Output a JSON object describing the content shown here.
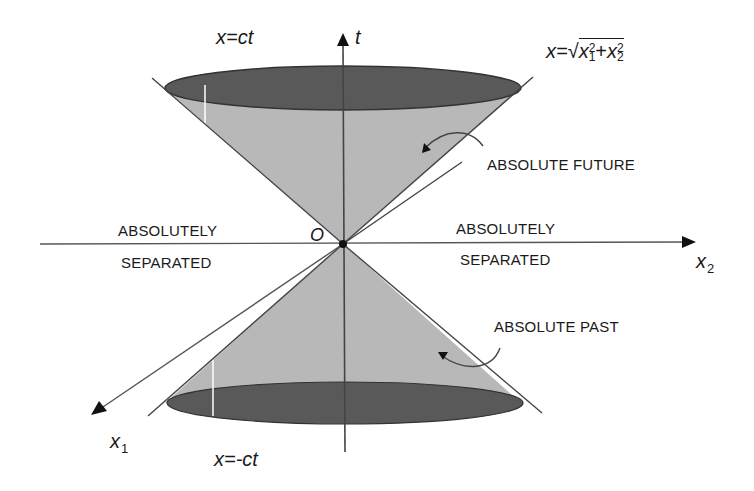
{
  "diagram": {
    "colors": {
      "cone_fill": "#b8b8b8",
      "ellipse_fill": "#595959",
      "lines": "#444444",
      "text": "#1a1a1a",
      "background": "#ffffff"
    },
    "axes": {
      "t_label": "t",
      "x1_label": "x",
      "x1_sub": "1",
      "x2_label": "x",
      "x2_sub": "2",
      "origin_label": "O"
    },
    "equations": {
      "future_line": "x=ct",
      "past_line": "x=-ct",
      "cone_lhs": "x=",
      "cone_term1": "x",
      "cone_term1_sup": "2",
      "cone_term1_sub": "1",
      "cone_plus": "+",
      "cone_term2": "x",
      "cone_term2_sup": "2",
      "cone_term2_sub": "2",
      "cone_sqrt": "√"
    },
    "regions": {
      "future": "ABSOLUTE FUTURE",
      "past": "ABSOLUTE PAST",
      "left_separated_line1": "ABSOLUTELY",
      "left_separated_line2": "SEPARATED",
      "right_separated_line1": "ABSOLUTELY",
      "right_separated_line2": "SEPARATED"
    }
  }
}
